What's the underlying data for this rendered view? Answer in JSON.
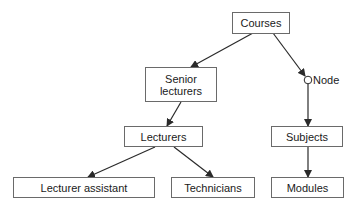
{
  "diagram": {
    "type": "hierarchy",
    "nodes": {
      "courses": "Courses",
      "senior_lecturers": "Senior\nlecturers",
      "senior_lecturers_line1": "Senior",
      "senior_lecturers_line2": "lecturers",
      "lecturers": "Lecturers",
      "lecturer_assistant": "Lecturer assistant",
      "technicians": "Technicians",
      "subjects": "Subjects",
      "modules": "Modules"
    },
    "node_marker_label": "Node",
    "edges": [
      {
        "from": "Courses",
        "to": "Senior lecturers"
      },
      {
        "from": "Courses",
        "to": "Node"
      },
      {
        "from": "Node",
        "to": "Subjects"
      },
      {
        "from": "Senior lecturers",
        "to": "Lecturers"
      },
      {
        "from": "Lecturers",
        "to": "Lecturer assistant"
      },
      {
        "from": "Lecturers",
        "to": "Technicians"
      },
      {
        "from": "Subjects",
        "to": "Modules"
      }
    ],
    "colors": {
      "stroke": "#2a2a2a",
      "box_border": "#6a6a6a",
      "text": "#1a1a1a"
    }
  }
}
